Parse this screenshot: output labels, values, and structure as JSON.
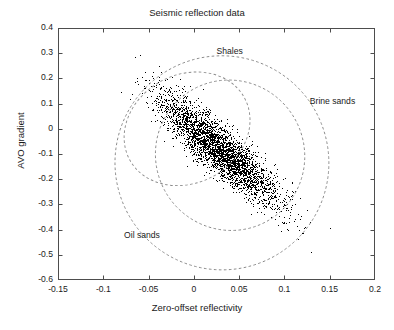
{
  "chart_data": {
    "type": "scatter",
    "title": "Seismic reflection data",
    "xlabel": "Zero-offset reflectivity",
    "ylabel": "AVO gradient",
    "xlim": [
      -0.15,
      0.2
    ],
    "ylim": [
      -0.6,
      0.4
    ],
    "xticks": [
      "-0.15",
      "-0.1",
      "-0.05",
      "0",
      "0.05",
      "0.1",
      "0.15",
      "0.2"
    ],
    "xtick_values": [
      -0.15,
      -0.1,
      -0.05,
      0,
      0.05,
      0.1,
      0.15,
      0.2
    ],
    "yticks": [
      "0.4",
      "0.3",
      "0.2",
      "0.1",
      "0",
      "-0.1",
      "-0.2",
      "-0.3",
      "-0.4",
      "-0.5",
      "-0.6"
    ],
    "ytick_values": [
      0.4,
      0.3,
      0.2,
      0.1,
      0,
      -0.1,
      -0.2,
      -0.3,
      -0.4,
      -0.5,
      -0.6
    ],
    "grid": false,
    "legend": "none",
    "point_color": "#000000",
    "contour_color": "#8a8a8a",
    "axis_color": "#4d4d4d",
    "series": [
      {
        "name": "seismic samples",
        "marker": "dot",
        "n_points": 9000,
        "center": [
          0.028,
          -0.082
        ],
        "sigma_x": 0.032,
        "sigma_y": 0.105,
        "correlation": -0.88,
        "description": "Dense elongated cloud of zero-offset reflectivity vs AVO gradient, negatively correlated, tilted down to the right."
      }
    ],
    "contours": [
      {
        "name": "Shales",
        "label": "Shales",
        "label_x": 0.025,
        "label_y": 0.305,
        "center": [
          -0.0075,
          0.0
        ],
        "rx": 0.072,
        "ry": 0.215,
        "rotation_deg": -28
      },
      {
        "name": "Brine sands",
        "label": "Brine sands",
        "label_x": 0.128,
        "label_y": 0.105,
        "center": [
          0.04,
          -0.105
        ],
        "rx": 0.082,
        "ry": 0.3,
        "rotation_deg": -33
      },
      {
        "name": "Oil sands",
        "label": "Oil sands",
        "label_x": -0.077,
        "label_y": -0.425,
        "center": [
          0.031,
          -0.135
        ],
        "rx": 0.118,
        "ry": 0.425,
        "rotation_deg": -33
      }
    ],
    "annotations": [
      "Shales",
      "Brine sands",
      "Oil sands"
    ]
  }
}
